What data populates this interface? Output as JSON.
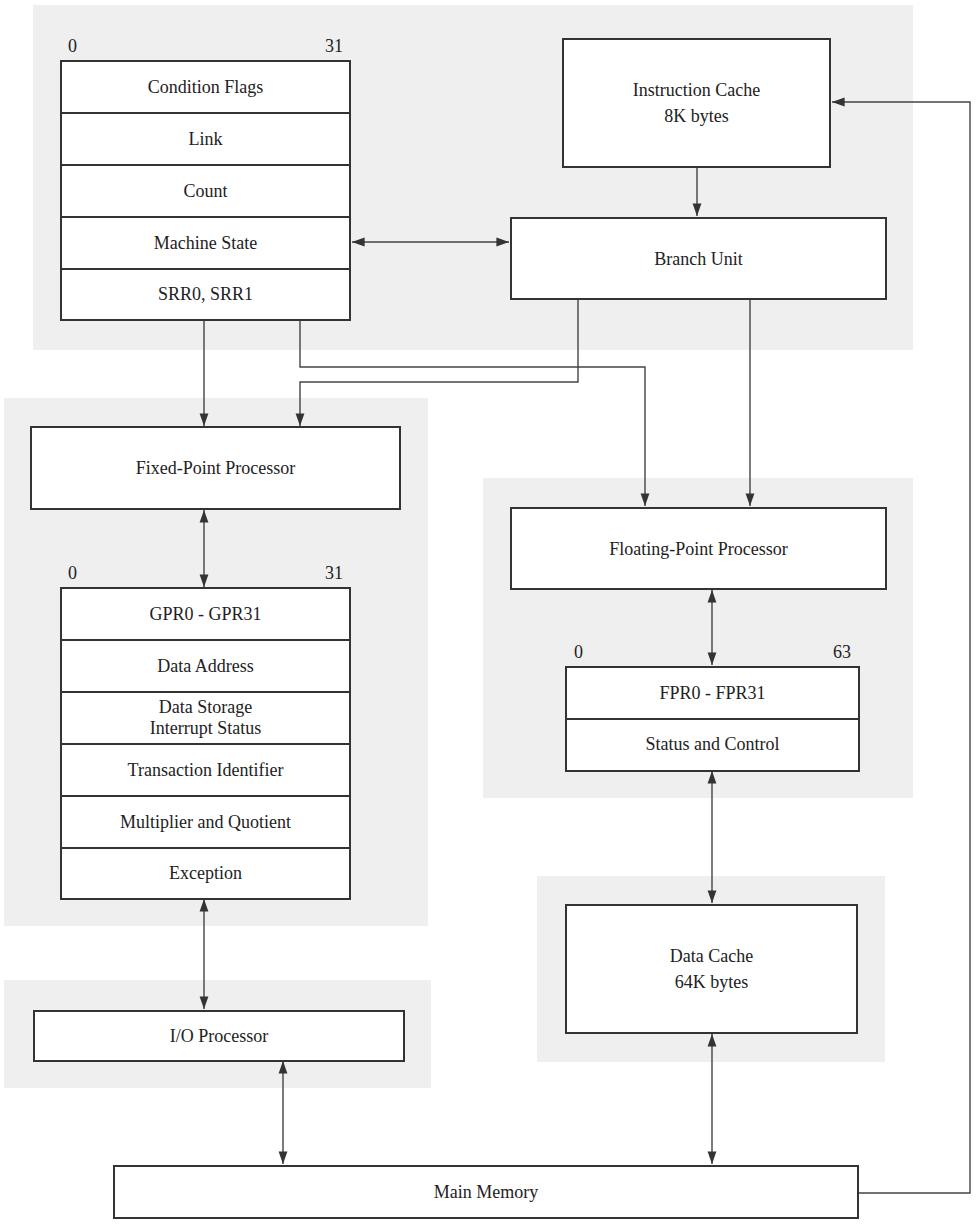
{
  "diagram": {
    "title": "",
    "regions": [
      {
        "id": "branch-region"
      },
      {
        "id": "fixed-point-region"
      },
      {
        "id": "floating-point-region"
      },
      {
        "id": "data-cache-region"
      },
      {
        "id": "io-region"
      }
    ],
    "branch_registers": {
      "bit_start": "0",
      "bit_end": "31",
      "rows": [
        "Condition Flags",
        "Link",
        "Count",
        "Machine State",
        "SRR0, SRR1"
      ]
    },
    "instruction_cache": {
      "line1": "Instruction Cache",
      "line2": "8K bytes"
    },
    "branch_unit": {
      "label": "Branch Unit"
    },
    "fixed_point_processor": {
      "label": "Fixed-Point Processor"
    },
    "fixed_point_registers": {
      "bit_start": "0",
      "bit_end": "31",
      "rows": [
        "GPR0 - GPR31",
        "Data Address",
        "Data Storage\nInterrupt Status",
        "Transaction Identifier",
        "Multiplier and Quotient",
        "Exception"
      ]
    },
    "floating_point_processor": {
      "label": "Floating-Point Processor"
    },
    "floating_point_registers": {
      "bit_start": "0",
      "bit_end": "63",
      "rows": [
        "FPR0 - FPR31",
        "Status and Control"
      ]
    },
    "data_cache": {
      "line1": "Data Cache",
      "line2": "64K bytes"
    },
    "io_processor": {
      "label": "I/O Processor"
    },
    "main_memory": {
      "label": "Main Memory"
    },
    "connections": [
      {
        "from": "Instruction Cache",
        "to": "Branch Unit",
        "type": "one-way"
      },
      {
        "from": "Branch registers (Machine State)",
        "to": "Branch Unit",
        "type": "bidirectional"
      },
      {
        "from": "Branch registers",
        "to": "Fixed-Point Processor",
        "type": "one-way"
      },
      {
        "from": "Branch registers",
        "to": "Floating-Point Processor",
        "type": "one-way"
      },
      {
        "from": "Branch Unit",
        "to": "Fixed-Point Processor",
        "type": "one-way"
      },
      {
        "from": "Branch Unit",
        "to": "Floating-Point Processor",
        "type": "one-way"
      },
      {
        "from": "Fixed-Point Processor",
        "to": "Fixed-point registers",
        "type": "bidirectional"
      },
      {
        "from": "Fixed-point registers",
        "to": "I/O Processor",
        "type": "bidirectional"
      },
      {
        "from": "I/O Processor",
        "to": "Main Memory",
        "type": "bidirectional"
      },
      {
        "from": "Floating-Point Processor",
        "to": "Floating-point registers",
        "type": "bidirectional"
      },
      {
        "from": "Floating-point registers",
        "to": "Data Cache",
        "type": "bidirectional"
      },
      {
        "from": "Data Cache",
        "to": "Main Memory",
        "type": "bidirectional"
      },
      {
        "from": "Main Memory",
        "to": "Instruction Cache",
        "type": "one-way"
      }
    ],
    "colors": {
      "region_bg": "#efefef",
      "stroke": "#333333",
      "box_fill": "#ffffff"
    }
  }
}
